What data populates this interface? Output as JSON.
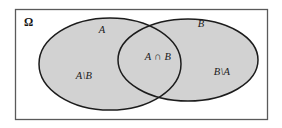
{
  "figure": {
    "kind": "venn-diagram",
    "background_color": "#ffffff",
    "set_fill_color": "#d2d2d2",
    "stroke_color": "#1c1c1c",
    "frame_stroke_color": "#5a5a5a",
    "label_color": "#1a1a1a"
  },
  "frame": {
    "name": "universe-rectangle",
    "x": 15,
    "y": 9,
    "width": 252,
    "height": 110
  },
  "sets": {
    "a": {
      "name": "set-a-ellipse",
      "cx": 110,
      "cy": 64,
      "rx": 71,
      "ry": 46
    },
    "b": {
      "name": "set-b-ellipse",
      "cx": 188,
      "cy": 60,
      "rx": 70,
      "ry": 41
    }
  },
  "labels": {
    "universe": {
      "text": "Ω",
      "x": 24,
      "y": 23
    },
    "set_a": {
      "text": "A",
      "x": 102,
      "y": 31
    },
    "set_b": {
      "text": "B",
      "x": 201,
      "y": 25
    },
    "intersection": {
      "text": "A ∩ B",
      "x": 158,
      "y": 58
    },
    "a_minus_b": {
      "text": "A\\B",
      "x": 84,
      "y": 77
    },
    "b_minus_a": {
      "text": "B\\A",
      "x": 222,
      "y": 73
    }
  }
}
